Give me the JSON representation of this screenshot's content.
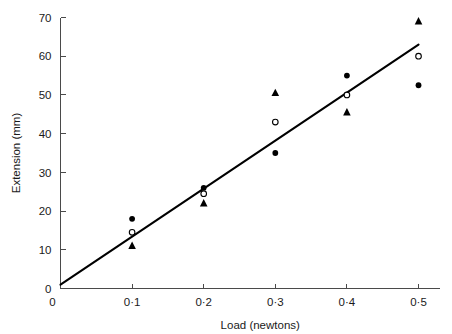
{
  "chart_data": {
    "type": "scatter",
    "title": "",
    "xlabel": "Load (newtons)",
    "ylabel": "Extension (mm)",
    "xlim": [
      0,
      0.53
    ],
    "ylim": [
      0,
      70
    ],
    "xticks": [
      "0",
      "0·1",
      "0·2",
      "0·3",
      "0·4",
      "0·5"
    ],
    "xtick_values": [
      0,
      0.1,
      0.2,
      0.3,
      0.4,
      0.5
    ],
    "yticks": [
      "0",
      "10",
      "20",
      "30",
      "40",
      "50",
      "60",
      "70"
    ],
    "ytick_values": [
      0,
      10,
      20,
      30,
      40,
      50,
      60,
      70
    ],
    "grid": false,
    "legend": "none",
    "x": [
      0.1,
      0.2,
      0.3,
      0.4,
      0.5
    ],
    "series": [
      {
        "name": "filled-circle",
        "marker": "filled-circle",
        "color": "#000000",
        "values": [
          18,
          26,
          35,
          55,
          52.5
        ]
      },
      {
        "name": "open-circle",
        "marker": "open-circle",
        "color": "#000000",
        "values": [
          14.5,
          24.5,
          43,
          50,
          60
        ]
      },
      {
        "name": "filled-triangle",
        "marker": "filled-triangle",
        "color": "#000000",
        "values": [
          11,
          22,
          50.5,
          45.5,
          69
        ]
      }
    ],
    "trend_line": {
      "name": "best-fit-line",
      "x": [
        0,
        0.5
      ],
      "y": [
        1,
        63
      ],
      "color": "#000000"
    }
  },
  "colors": {
    "axis": "#4a4a4a",
    "marker": "#000000",
    "line": "#000000",
    "background": "#ffffff"
  }
}
